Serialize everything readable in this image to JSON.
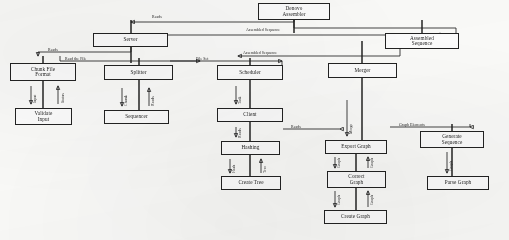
{
  "diagram": {
    "title": "Denovo Assembler",
    "type": "flow-sequence-diagram",
    "nodes": [
      {
        "id": "denovo_assembler",
        "label": "Denovo\nAssembler",
        "x": 258,
        "y": 3,
        "w": 72,
        "h": 17
      },
      {
        "id": "server",
        "label": "Server",
        "x": 93,
        "y": 33,
        "w": 75,
        "h": 14
      },
      {
        "id": "assembled_seq",
        "label": "Assembled\nSequence",
        "x": 385,
        "y": 33,
        "w": 74,
        "h": 16
      },
      {
        "id": "chunk_file_format",
        "label": "Chunk File\nFormat",
        "x": 10,
        "y": 63,
        "w": 66,
        "h": 18
      },
      {
        "id": "splitter",
        "label": "Splitter",
        "x": 104,
        "y": 65,
        "w": 69,
        "h": 15
      },
      {
        "id": "scheduler",
        "label": "Scheduler",
        "x": 217,
        "y": 65,
        "w": 66,
        "h": 15
      },
      {
        "id": "merger",
        "label": "Merger",
        "x": 328,
        "y": 63,
        "w": 69,
        "h": 15
      },
      {
        "id": "validate_input",
        "label": "Validate\nInput",
        "x": 15,
        "y": 108,
        "w": 57,
        "h": 17
      },
      {
        "id": "sequencer",
        "label": "Sequencer",
        "x": 104,
        "y": 110,
        "w": 65,
        "h": 14
      },
      {
        "id": "client",
        "label": "Client",
        "x": 217,
        "y": 108,
        "w": 66,
        "h": 14
      },
      {
        "id": "hashing",
        "label": "Hashing",
        "x": 221,
        "y": 141,
        "w": 59,
        "h": 14
      },
      {
        "id": "export_graph",
        "label": "Export Graph",
        "x": 325,
        "y": 140,
        "w": 62,
        "h": 14
      },
      {
        "id": "generate_seq",
        "label": "Generate\nSequence",
        "x": 420,
        "y": 131,
        "w": 64,
        "h": 17
      },
      {
        "id": "create_tree",
        "label": "Create Tree",
        "x": 221,
        "y": 176,
        "w": 60,
        "h": 14
      },
      {
        "id": "correct_graph",
        "label": "Correct\nGraph",
        "x": 327,
        "y": 171,
        "w": 59,
        "h": 17
      },
      {
        "id": "parse_graph",
        "label": "Parse Graph",
        "x": 427,
        "y": 176,
        "w": 62,
        "h": 14
      },
      {
        "id": "create_graph",
        "label": "Create Graph",
        "x": 324,
        "y": 210,
        "w": 63,
        "h": 14
      }
    ],
    "edge_labels": [
      {
        "id": "reads_top",
        "text": "Reads",
        "x": 152,
        "y": 16,
        "rotate": false
      },
      {
        "id": "assembled_seq_1",
        "text": "Assembled Sequence",
        "x": 246,
        "y": 29,
        "rotate": false
      },
      {
        "id": "assembled_seq_2",
        "text": "Assembled Sequence",
        "x": 243,
        "y": 52,
        "rotate": false
      },
      {
        "id": "reads_server",
        "text": "Reads",
        "x": 48,
        "y": 49,
        "rotate": false
      },
      {
        "id": "read_the_file",
        "text": "Read the File",
        "x": 65,
        "y": 58,
        "rotate": false
      },
      {
        "id": "file_set",
        "text": "File Set",
        "x": 196,
        "y": 58,
        "rotate": false
      },
      {
        "id": "reads_client",
        "text": "Reads",
        "x": 291,
        "y": 126,
        "rotate": false
      },
      {
        "id": "graph_elements",
        "text": "Graph Elements",
        "x": 399,
        "y": 124,
        "rotate": false
      },
      {
        "id": "v_chunk_validate",
        "text": "Input",
        "x": 34,
        "y": 103,
        "rotate": true
      },
      {
        "id": "v_validate_chunk",
        "text": "Status",
        "x": 62,
        "y": 103,
        "rotate": true
      },
      {
        "id": "v_split_seq",
        "text": "Chunk",
        "x": 125,
        "y": 106,
        "rotate": true
      },
      {
        "id": "v_seq_split",
        "text": "Reads",
        "x": 152,
        "y": 106,
        "rotate": true
      },
      {
        "id": "v_sched_client",
        "text": "Task",
        "x": 239,
        "y": 104,
        "rotate": true
      },
      {
        "id": "v_client_hash",
        "text": "Reads",
        "x": 239,
        "y": 138,
        "rotate": true
      },
      {
        "id": "v_hash_tree",
        "text": "Hash",
        "x": 233,
        "y": 173,
        "rotate": true
      },
      {
        "id": "v_tree_hash",
        "text": "Tree",
        "x": 264,
        "y": 173,
        "rotate": true
      },
      {
        "id": "v_merger_export",
        "text": "Merge",
        "x": 350,
        "y": 134,
        "rotate": true
      },
      {
        "id": "v_export_correct",
        "text": "Graph",
        "x": 338,
        "y": 168,
        "rotate": true
      },
      {
        "id": "v_correct_export",
        "text": "Graph",
        "x": 371,
        "y": 168,
        "rotate": true
      },
      {
        "id": "v_correct_create",
        "text": "Graph",
        "x": 338,
        "y": 205,
        "rotate": true
      },
      {
        "id": "v_create_correct",
        "text": "Graph",
        "x": 371,
        "y": 205,
        "rotate": true
      },
      {
        "id": "v_gen_parse",
        "text": "Graph",
        "x": 450,
        "y": 171,
        "rotate": true
      }
    ]
  }
}
